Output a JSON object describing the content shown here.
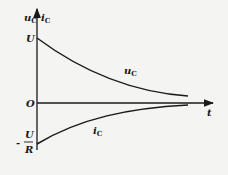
{
  "diagram": {
    "type": "rc-discharge-curves",
    "axes": {
      "y_label_voltage": "u",
      "y_label_voltage_sub": "C",
      "y_label_current": "i",
      "y_label_current_sub": "C",
      "x_label": "t",
      "origin_label": "O"
    },
    "y_ticks": {
      "upper": "U",
      "lower_numerator": "U",
      "lower_denominator": "R",
      "lower_sign": "-"
    },
    "curves": [
      {
        "name": "u",
        "sub": "C",
        "start": "U",
        "end": "0",
        "shape": "exponential decay"
      },
      {
        "name": "i",
        "sub": "C",
        "start": "-U/R",
        "end": "0",
        "shape": "exponential rise to zero"
      }
    ],
    "colors": {
      "stroke": "#1a1a1a",
      "background": "#f4f4f2"
    }
  }
}
